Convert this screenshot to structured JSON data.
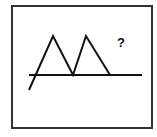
{
  "diagram": {
    "question_mark": "?",
    "stroke_color": "#111111",
    "frame_color": "#333333",
    "baseline": {
      "x1": 29,
      "y1": 75,
      "x2": 142,
      "y2": 75
    },
    "zigzag_points": [
      [
        29,
        90
      ],
      [
        53,
        36
      ],
      [
        73,
        75
      ],
      [
        86,
        36
      ],
      [
        110,
        75
      ]
    ]
  }
}
